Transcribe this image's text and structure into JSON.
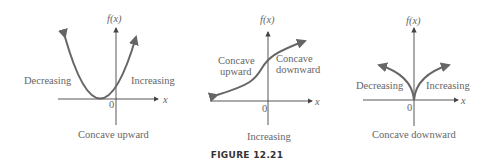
{
  "figure": {
    "caption": "FIGURE 12.21",
    "panels": [
      {
        "y_label": "f(x)",
        "x_label": "x",
        "origin": "0",
        "left_label": "Decreasing",
        "right_label": "Increasing",
        "bottom_label": "Concave upward"
      },
      {
        "y_label": "f(x)",
        "x_label": "x",
        "origin": "0",
        "left_label_line1": "Concave",
        "left_label_line2": "upward",
        "right_label_line1": "Concave",
        "right_label_line2": "downward",
        "bottom_label": "Increasing"
      },
      {
        "y_label": "f(x)",
        "x_label": "x",
        "origin": "0",
        "left_label": "Decreasing",
        "right_label": "Increasing",
        "bottom_label": "Concave downward"
      }
    ],
    "colors": {
      "curve": "#666666",
      "axis": "#444444",
      "text": "#666666"
    }
  }
}
